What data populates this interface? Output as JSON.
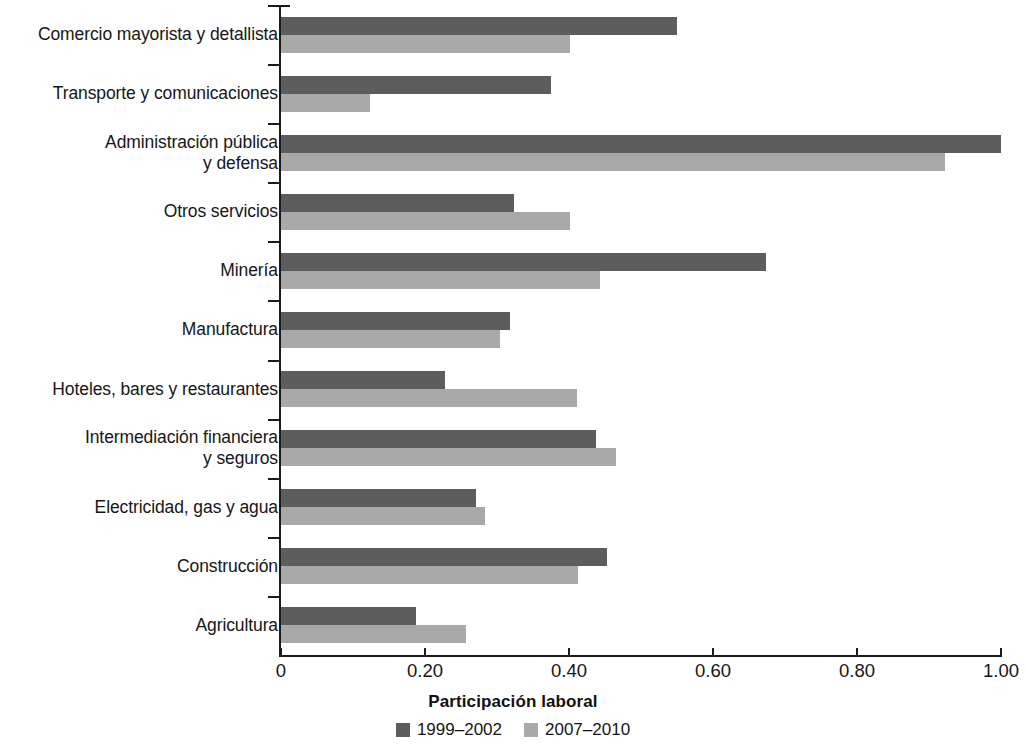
{
  "chart_data": {
    "type": "bar",
    "orientation": "horizontal",
    "title": "",
    "xlabel": "Participación laboral",
    "ylabel": "",
    "xlim": [
      0,
      1.0
    ],
    "xticks": [
      0,
      0.2,
      0.4,
      0.6,
      0.8,
      1.0
    ],
    "xtick_labels": [
      "0",
      "0.20",
      "0.40",
      "0.60",
      "0.80",
      "1.00"
    ],
    "grid": false,
    "legend_position": "bottom",
    "categories": [
      "Comercio mayorista y detallista",
      "Transporte y comunicaciones",
      "Administración pública\ny defensa",
      "Otros servicios",
      "Minería",
      "Manufactura",
      "Hoteles, bares y restaurantes",
      "Intermediación financiera\ny seguros",
      "Electricidad, gas y agua",
      "Construcción",
      "Agricultura"
    ],
    "series": [
      {
        "name": "1999–2002",
        "color": "#5d5d5d",
        "values": [
          0.55,
          0.375,
          1.0,
          0.324,
          0.674,
          0.318,
          0.228,
          0.437,
          0.271,
          0.453,
          0.188
        ]
      },
      {
        "name": "2007–2010",
        "color": "#a9a9a9",
        "values": [
          0.401,
          0.124,
          0.922,
          0.401,
          0.443,
          0.304,
          0.411,
          0.465,
          0.283,
          0.412,
          0.257
        ]
      }
    ]
  },
  "legend": {
    "entries": [
      {
        "label": "1999–2002",
        "swatch": "series-a"
      },
      {
        "label": "2007–2010",
        "swatch": "series-b"
      }
    ]
  }
}
